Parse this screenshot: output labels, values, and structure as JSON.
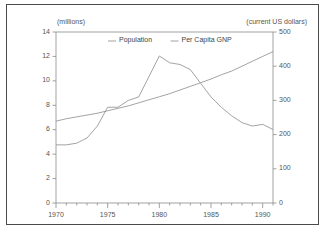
{
  "chart_data": {
    "type": "line",
    "title": "",
    "subtitle": "",
    "xlabel": "",
    "ylabel": "(millions)",
    "y2label": "(current US dollars)",
    "xlim": [
      1970,
      1991
    ],
    "ylim": [
      0,
      14
    ],
    "y2lim": [
      0,
      500
    ],
    "grid": false,
    "legend_position": "top-center",
    "xticks": [
      "1970",
      "1975",
      "1980",
      "1985",
      "1990"
    ],
    "xtick_values": [
      1970,
      1975,
      1980,
      1985,
      1990
    ],
    "xminor_step": 1,
    "yticks": [
      "0",
      "2",
      "4",
      "6",
      "8",
      "10",
      "12",
      "14"
    ],
    "ytick_values": [
      0,
      2,
      4,
      6,
      8,
      10,
      12,
      14
    ],
    "y2ticks": [
      "0",
      "100",
      "200",
      "300",
      "400",
      "500"
    ],
    "y2tick_values": [
      0,
      100,
      200,
      300,
      400,
      500
    ],
    "x": [
      1970,
      1971,
      1972,
      1973,
      1974,
      1975,
      1976,
      1977,
      1978,
      1979,
      1980,
      1981,
      1982,
      1983,
      1984,
      1985,
      1986,
      1987,
      1988,
      1989,
      1990,
      1991
    ],
    "series": [
      {
        "name": "Population",
        "axis": "left",
        "unit": "millions",
        "color": "#8c8c8c",
        "values": [
          6.7,
          6.9,
          7.05,
          7.2,
          7.35,
          7.55,
          7.75,
          7.95,
          8.2,
          8.45,
          8.7,
          8.95,
          9.25,
          9.55,
          9.85,
          10.15,
          10.5,
          10.8,
          11.2,
          11.6,
          12.0,
          12.4
        ]
      },
      {
        "name": "Per Capita GNP",
        "axis": "right",
        "unit": "current US dollars",
        "color": "#8c8c8c",
        "values": [
          170,
          170,
          175,
          190,
          225,
          280,
          280,
          300,
          310,
          370,
          430,
          410,
          405,
          390,
          350,
          310,
          280,
          255,
          235,
          225,
          230,
          215
        ]
      }
    ],
    "legend": [
      "Population",
      "Per Capita GNP"
    ]
  },
  "colors": {
    "frame_border": "#4a4a4a",
    "axis": "#8a8a8a",
    "text": "#555555",
    "background": "#ffffff"
  }
}
